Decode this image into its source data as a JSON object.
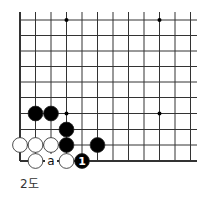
{
  "diagram": {
    "caption": "2도",
    "grid": {
      "x": [
        20,
        35.5,
        51,
        66.5,
        82,
        97.5,
        113,
        128.5,
        144,
        159.5,
        175,
        190.5
      ],
      "y": [
        20,
        35.5,
        51,
        66.5,
        82,
        97.5,
        113.5,
        129.5,
        145,
        161
      ],
      "right_extent": 197,
      "top_extent": 12,
      "left_edge_thick": true,
      "bottom_edge_thick": true
    },
    "star_points": [
      [
        3,
        0
      ],
      [
        9,
        0
      ],
      [
        3,
        6
      ],
      [
        9,
        6
      ]
    ],
    "stones": [
      {
        "color": "black",
        "col": 1,
        "row": 6
      },
      {
        "color": "black",
        "col": 2,
        "row": 6
      },
      {
        "color": "black",
        "col": 3,
        "row": 7
      },
      {
        "color": "black",
        "col": 3,
        "row": 8
      },
      {
        "color": "black",
        "col": 5,
        "row": 8
      },
      {
        "color": "white",
        "col": 0,
        "row": 8
      },
      {
        "color": "white",
        "col": 1,
        "row": 8
      },
      {
        "color": "white",
        "col": 2,
        "row": 8
      },
      {
        "color": "white",
        "col": 1,
        "row": 9
      },
      {
        "color": "white",
        "col": 3,
        "row": 9
      },
      {
        "color": "black",
        "col": 4,
        "row": 9,
        "label": "1"
      }
    ],
    "marks": [
      {
        "col": 2,
        "row": 9,
        "label": "a"
      }
    ],
    "colors": {
      "line": "#333333",
      "black_stone": "#000000",
      "white_stone": "#ffffff",
      "stone_outline": "#222222"
    }
  }
}
